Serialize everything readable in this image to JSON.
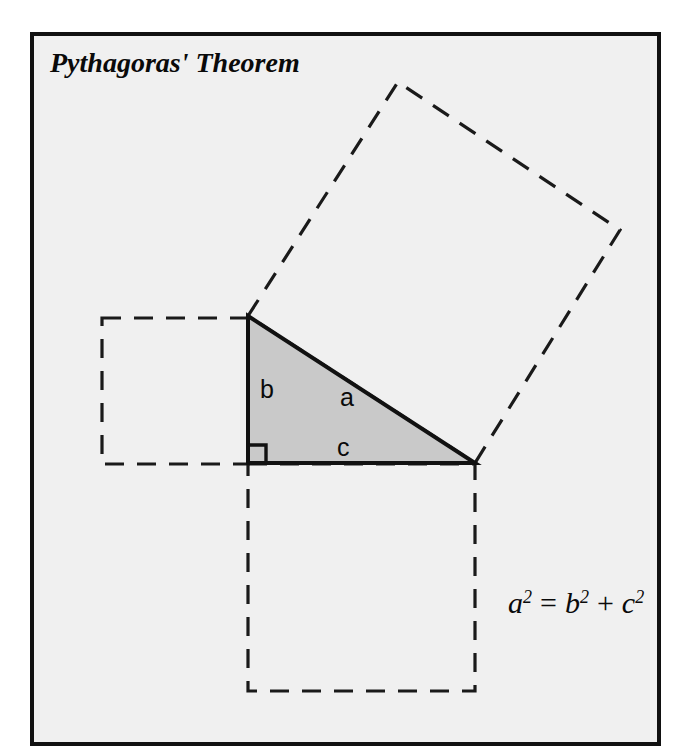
{
  "figure": {
    "title": "Pythagoras' Theorem",
    "formula": {
      "full": "a2 = b2 + c2",
      "lhs_base": "a",
      "lhs_exp": "2",
      "equals": "=",
      "rhs1_base": "b",
      "rhs1_exp": "2",
      "plus": "+",
      "rhs2_base": "c",
      "rhs2_exp": "2"
    },
    "labels": {
      "hypotenuse": "a",
      "vertical_leg": "b",
      "horizontal_leg": "c"
    },
    "colors": {
      "frame_border": "#111111",
      "panel_background": "#f0f0f0",
      "triangle_fill": "#c9c9c9",
      "triangle_stroke": "#111111",
      "dashed_square_stroke": "#1a1a1a",
      "text": "#0a0a0a",
      "page_background": "#ffffff"
    },
    "geometry": {
      "frame": {
        "x": 32,
        "y": 34,
        "width": 627,
        "height": 710
      },
      "triangle_vertices": {
        "apex_top": [
          248,
          316
        ],
        "right_angle": [
          248,
          463
        ],
        "right_end": [
          475,
          463
        ]
      },
      "side_lengths_px": {
        "a": 270,
        "b": 147,
        "c": 227
      },
      "square_on_b": [
        [
          102,
          318
        ],
        [
          248,
          318
        ],
        [
          248,
          464
        ],
        [
          102,
          464
        ]
      ],
      "square_on_c": [
        [
          248,
          464
        ],
        [
          475,
          464
        ],
        [
          475,
          691
        ],
        [
          248,
          691
        ]
      ],
      "square_on_a": [
        [
          248,
          316
        ],
        [
          398,
          82
        ],
        [
          620,
          230
        ],
        [
          475,
          463
        ]
      ],
      "right_angle_marker": {
        "x": 248,
        "y": 463,
        "size": 18
      }
    }
  }
}
